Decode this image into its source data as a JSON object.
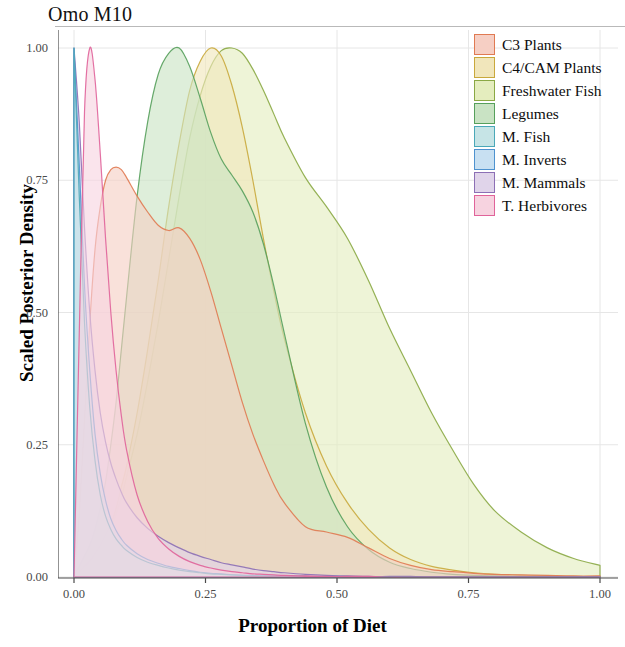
{
  "chart": {
    "title": "Omo M10",
    "xlabel": "Proportion of Diet",
    "ylabel": "Scaled Posterior Density"
  },
  "axes": {
    "x_ticks": [
      "0.00",
      "0.25",
      "0.50",
      "0.75",
      "1.00"
    ],
    "y_ticks": [
      "0.00",
      "0.25",
      "0.50",
      "0.75",
      "1.00"
    ]
  },
  "legend": {
    "items": [
      {
        "label": "C3 Plants",
        "fill": "#f6cfc4",
        "stroke": "#e07a52"
      },
      {
        "label": "C4/CAM Plants",
        "fill": "#f1e6bb",
        "stroke": "#c9a83c"
      },
      {
        "label": "Freshwater Fish",
        "fill": "#e4edbe",
        "stroke": "#8aa844"
      },
      {
        "label": "Legumes",
        "fill": "#c9e3c4",
        "stroke": "#56a05c"
      },
      {
        "label": "M. Fish",
        "fill": "#c6e4e6",
        "stroke": "#4aa8b8"
      },
      {
        "label": "M. Inverts",
        "fill": "#c8e0f2",
        "stroke": "#4e92cf"
      },
      {
        "label": "M. Mammals",
        "fill": "#e0d4ea",
        "stroke": "#8c6fb5"
      },
      {
        "label": "T. Herbivores",
        "fill": "#f7d3e0",
        "stroke": "#e0639a"
      }
    ]
  },
  "chart_data": {
    "type": "area",
    "title": "Omo M10",
    "xlabel": "Proportion of Diet",
    "ylabel": "Scaled Posterior Density",
    "xlim": [
      0.0,
      1.0
    ],
    "ylim": [
      0.0,
      1.0
    ],
    "grid": true,
    "legend_position": "top-right",
    "x": [
      0.0,
      0.01,
      0.02,
      0.03,
      0.04,
      0.05,
      0.06,
      0.07,
      0.08,
      0.09,
      0.1,
      0.12,
      0.14,
      0.16,
      0.18,
      0.2,
      0.22,
      0.24,
      0.26,
      0.28,
      0.3,
      0.32,
      0.34,
      0.36,
      0.38,
      0.4,
      0.44,
      0.48,
      0.52,
      0.56,
      0.6,
      0.64,
      0.68,
      0.72,
      0.76,
      0.8,
      0.85,
      0.9,
      0.95,
      1.0
    ],
    "series": [
      {
        "name": "C3 Plants",
        "fill": "#f6cfc4",
        "stroke": "#e07a52",
        "values": [
          0.0,
          0.12,
          0.3,
          0.48,
          0.62,
          0.7,
          0.75,
          0.77,
          0.775,
          0.77,
          0.755,
          0.72,
          0.69,
          0.665,
          0.655,
          0.66,
          0.64,
          0.6,
          0.54,
          0.47,
          0.4,
          0.33,
          0.27,
          0.22,
          0.175,
          0.14,
          0.095,
          0.085,
          0.075,
          0.055,
          0.035,
          0.022,
          0.014,
          0.01,
          0.007,
          0.005,
          0.004,
          0.003,
          0.002,
          0.002
        ]
      },
      {
        "name": "C4/CAM Plants",
        "fill": "#f1e6bb",
        "stroke": "#c9a83c",
        "values": [
          0.0,
          0.01,
          0.02,
          0.03,
          0.045,
          0.06,
          0.08,
          0.1,
          0.13,
          0.17,
          0.21,
          0.31,
          0.43,
          0.56,
          0.7,
          0.82,
          0.92,
          0.975,
          1.0,
          0.985,
          0.93,
          0.85,
          0.75,
          0.64,
          0.54,
          0.45,
          0.31,
          0.21,
          0.14,
          0.09,
          0.055,
          0.033,
          0.02,
          0.013,
          0.008,
          0.005,
          0.003,
          0.002,
          0.001,
          0.001
        ]
      },
      {
        "name": "Freshwater Fish",
        "fill": "#e4edbe",
        "stroke": "#8aa844",
        "values": [
          0.0,
          0.01,
          0.02,
          0.03,
          0.04,
          0.055,
          0.07,
          0.09,
          0.12,
          0.15,
          0.19,
          0.27,
          0.37,
          0.48,
          0.6,
          0.72,
          0.83,
          0.91,
          0.965,
          0.995,
          1.0,
          0.99,
          0.96,
          0.92,
          0.875,
          0.83,
          0.755,
          0.7,
          0.64,
          0.56,
          0.47,
          0.39,
          0.31,
          0.24,
          0.175,
          0.125,
          0.085,
          0.055,
          0.035,
          0.022
        ]
      },
      {
        "name": "Legumes",
        "fill": "#c9e3c4",
        "stroke": "#56a05c",
        "values": [
          0.0,
          0.02,
          0.04,
          0.06,
          0.09,
          0.13,
          0.18,
          0.25,
          0.33,
          0.43,
          0.53,
          0.72,
          0.86,
          0.95,
          0.99,
          1.0,
          0.965,
          0.905,
          0.84,
          0.79,
          0.76,
          0.73,
          0.69,
          0.63,
          0.55,
          0.46,
          0.29,
          0.17,
          0.095,
          0.052,
          0.028,
          0.016,
          0.009,
          0.005,
          0.003,
          0.002,
          0.001,
          0.001,
          0.0,
          0.0
        ]
      },
      {
        "name": "M. Fish",
        "fill": "#c6e4e6",
        "stroke": "#4aa8b8",
        "values": [
          1.0,
          0.72,
          0.48,
          0.32,
          0.22,
          0.155,
          0.115,
          0.09,
          0.072,
          0.06,
          0.05,
          0.037,
          0.028,
          0.022,
          0.017,
          0.013,
          0.01,
          0.008,
          0.006,
          0.005,
          0.004,
          0.003,
          0.002,
          0.002,
          0.001,
          0.001,
          0.001,
          0.0,
          0.0,
          0.0,
          0.0,
          0.0,
          0.0,
          0.0,
          0.0,
          0.0,
          0.0,
          0.0,
          0.0,
          0.0
        ]
      },
      {
        "name": "M. Inverts",
        "fill": "#c8e0f2",
        "stroke": "#4e92cf",
        "values": [
          1.0,
          0.78,
          0.55,
          0.39,
          0.27,
          0.195,
          0.145,
          0.11,
          0.088,
          0.072,
          0.06,
          0.044,
          0.033,
          0.026,
          0.02,
          0.016,
          0.012,
          0.009,
          0.007,
          0.006,
          0.004,
          0.003,
          0.003,
          0.002,
          0.002,
          0.001,
          0.001,
          0.0,
          0.0,
          0.0,
          0.0,
          0.0,
          0.0,
          0.0,
          0.0,
          0.0,
          0.0,
          0.0,
          0.0,
          0.0
        ]
      },
      {
        "name": "M. Mammals",
        "fill": "#e0d4ea",
        "stroke": "#8c6fb5",
        "values": [
          1.0,
          0.86,
          0.66,
          0.5,
          0.39,
          0.31,
          0.255,
          0.215,
          0.185,
          0.16,
          0.14,
          0.112,
          0.092,
          0.077,
          0.065,
          0.055,
          0.046,
          0.039,
          0.033,
          0.027,
          0.023,
          0.019,
          0.015,
          0.012,
          0.01,
          0.008,
          0.005,
          0.003,
          0.002,
          0.001,
          0.001,
          0.001,
          0.0,
          0.0,
          0.0,
          0.0,
          0.0,
          0.0,
          0.0,
          0.0
        ]
      },
      {
        "name": "T. Herbivores",
        "fill": "#f7d3e0",
        "stroke": "#e0639a",
        "values": [
          0.0,
          0.46,
          0.88,
          1.0,
          0.94,
          0.8,
          0.64,
          0.5,
          0.39,
          0.305,
          0.24,
          0.155,
          0.105,
          0.073,
          0.053,
          0.039,
          0.029,
          0.022,
          0.017,
          0.013,
          0.01,
          0.008,
          0.006,
          0.005,
          0.004,
          0.003,
          0.002,
          0.001,
          0.001,
          0.001,
          0.0,
          0.0,
          0.0,
          0.0,
          0.0,
          0.0,
          0.0,
          0.0,
          0.0,
          0.0
        ]
      }
    ]
  }
}
